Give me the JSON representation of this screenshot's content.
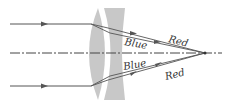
{
  "diagram": {
    "labels": {
      "upper_red": "Red",
      "upper_blue": "Blue",
      "lower_blue": "Blue",
      "lower_red": "Red"
    },
    "colors": {
      "lens": "#c8c8c8",
      "ray": "#555555",
      "axis": "#444444",
      "text": "#333333"
    },
    "elements": [
      {
        "id": "converging-lens",
        "type": "convex lens"
      },
      {
        "id": "diverging-lens",
        "type": "concave lens"
      },
      {
        "id": "optical-axis",
        "type": "dash-dot line"
      },
      {
        "id": "focal-point",
        "type": "convergence point"
      }
    ]
  }
}
